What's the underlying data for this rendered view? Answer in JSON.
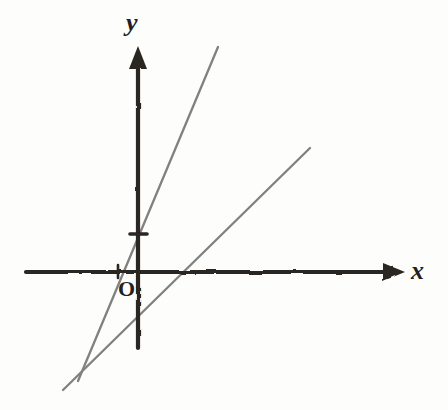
{
  "figure": {
    "kind": "cartesian-coordinate-plane-with-two-lines",
    "background_color": "#fdfdfb",
    "axis_color": "#2b2520",
    "line_color": "#7f8280",
    "labels": {
      "y_axis": "y",
      "x_axis": "x",
      "origin": "O"
    }
  },
  "chart_data": {
    "type": "line",
    "title": "",
    "subtitle": "",
    "xlabel": "x",
    "ylabel": "y",
    "grid": false,
    "legend": "none",
    "annotations": [
      "O"
    ],
    "axes": {
      "x_axis": {
        "label": "x",
        "orientation": "horizontal",
        "pixel_y": 272,
        "pixel_x_start": 26,
        "pixel_x_end": 405,
        "arrow": "right",
        "ticks": [
          {
            "label": "",
            "pixel_x": 118,
            "note": "unlabeled tick left of origin"
          }
        ]
      },
      "y_axis": {
        "label": "y",
        "orientation": "vertical",
        "pixel_x": 138,
        "pixel_y_top": 47,
        "pixel_y_bottom": 348,
        "arrow": "up",
        "ticks": [
          {
            "label": "",
            "pixel_y": 234,
            "note": "unlabeled tick above origin"
          }
        ]
      },
      "origin": {
        "label": "O",
        "pixel_x": 138,
        "pixel_y": 272
      }
    },
    "series": [
      {
        "name": "steep-line",
        "description": "steeper line, positive slope, positive y-intercept",
        "points": [
          {
            "x_px": 218,
            "y_px": 47
          },
          {
            "x_px": 78,
            "y_px": 381
          }
        ],
        "y_intercept_px": {
          "x_px": 138,
          "y_px": 224
        },
        "x_intercept_px": {
          "x_px": 118,
          "y_px": 272
        },
        "color": "#7f8280"
      },
      {
        "name": "shallow-line",
        "description": "shallower line, positive slope, negative y-intercept",
        "points": [
          {
            "x_px": 310,
            "y_px": 148
          },
          {
            "x_px": 63,
            "y_px": 390
          }
        ],
        "y_intercept_px": {
          "x_px": 138,
          "y_px": 316
        },
        "x_intercept_px": {
          "x_px": 180,
          "y_px": 272
        },
        "color": "#7f8280"
      }
    ]
  }
}
